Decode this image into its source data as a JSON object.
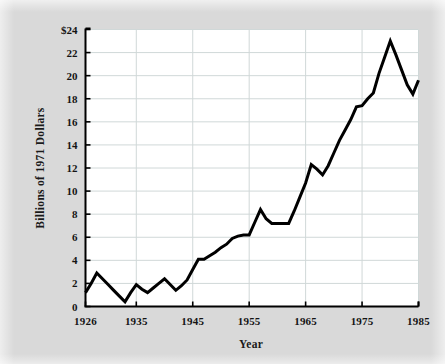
{
  "chart_data": {
    "type": "line",
    "title": "",
    "xlabel": "Year",
    "ylabel": "Billions of 1971 Dollars",
    "xlim": [
      1926,
      1985
    ],
    "ylim": [
      0,
      24
    ],
    "grid": true,
    "legend": "none",
    "y_ticks": [
      0,
      2,
      4,
      6,
      8,
      10,
      12,
      14,
      16,
      18,
      20,
      22,
      24
    ],
    "y_tick_labels": [
      "0",
      "2",
      "4",
      "6",
      "8",
      "10",
      "12",
      "14",
      "16",
      "18",
      "20",
      "22",
      "$24"
    ],
    "x_ticks": [
      1926,
      1935,
      1945,
      1955,
      1965,
      1975,
      1985
    ],
    "x_tick_labels": [
      "1926",
      "1935",
      "1945",
      "1955",
      "1965",
      "1975",
      "1985"
    ],
    "series": [
      {
        "name": "Expenditures",
        "color": "#000000",
        "x": [
          1926,
          1927,
          1928,
          1929,
          1930,
          1931,
          1932,
          1933,
          1934,
          1935,
          1936,
          1937,
          1938,
          1939,
          1940,
          1941,
          1942,
          1943,
          1944,
          1945,
          1946,
          1947,
          1948,
          1949,
          1950,
          1951,
          1952,
          1953,
          1954,
          1955,
          1956,
          1957,
          1958,
          1959,
          1960,
          1961,
          1962,
          1963,
          1964,
          1965,
          1966,
          1967,
          1968,
          1969,
          1970,
          1971,
          1972,
          1973,
          1974,
          1975,
          1976,
          1977,
          1978,
          1979,
          1980,
          1981,
          1982,
          1983,
          1984,
          1985
        ],
        "y": [
          1.2,
          2.0,
          2.9,
          2.4,
          1.9,
          1.4,
          0.9,
          0.4,
          1.2,
          1.9,
          1.5,
          1.2,
          1.6,
          2.0,
          2.4,
          1.9,
          1.4,
          1.8,
          2.3,
          3.2,
          4.1,
          4.1,
          4.4,
          4.7,
          5.1,
          5.4,
          5.9,
          6.1,
          6.2,
          6.2,
          7.3,
          8.4,
          7.6,
          7.2,
          7.2,
          7.2,
          7.2,
          8.3,
          9.5,
          10.7,
          12.3,
          11.9,
          11.4,
          12.2,
          13.3,
          14.4,
          15.3,
          16.2,
          17.3,
          17.4,
          18.0,
          18.5,
          20.2,
          21.6,
          23.0,
          21.8,
          20.5,
          19.2,
          18.4,
          19.6
        ]
      }
    ]
  },
  "figure": {
    "background_color": "#d9d9d9",
    "plot_background_color": "#ffffff",
    "gridline_color": "#d0d8d8",
    "axis_color": "#000000",
    "line_color": "#000000",
    "line_width": 3
  }
}
